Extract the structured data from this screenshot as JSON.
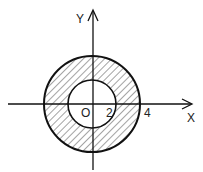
{
  "diagram": {
    "type": "annulus-region",
    "axes": {
      "x_label": "X",
      "y_label": "Y",
      "origin_label": "O"
    },
    "tick_labels": {
      "inner_radius": "2",
      "outer_radius": "4"
    },
    "circles": [
      {
        "name": "inner",
        "radius": 2,
        "style": "solid"
      },
      {
        "name": "outer",
        "radius": 4,
        "style": "solid"
      }
    ],
    "shaded_region": "2 <= r <= 4 (hatched)",
    "colors": {
      "stroke": "#111111",
      "hatch": "#333333",
      "background": "#ffffff"
    }
  }
}
